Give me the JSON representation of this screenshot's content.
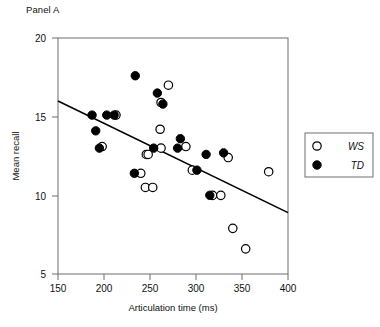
{
  "panel": {
    "label": "Panel A"
  },
  "axes": {
    "x_title": "Articulation time (ms)",
    "y_title": "Mean recall",
    "x_ticks": [
      "150",
      "200",
      "250",
      "300",
      "350",
      "400"
    ],
    "y_ticks": [
      "20",
      "15",
      "10",
      "5"
    ]
  },
  "legend": {
    "items": [
      {
        "label": "WS",
        "marker": "open-circle"
      },
      {
        "label": "TD",
        "marker": "filled-circle"
      }
    ]
  },
  "chart_data": {
    "type": "scatter",
    "title": "Panel A",
    "xlabel": "Articulation time (ms)",
    "ylabel": "Mean recall",
    "xlim": [
      150,
      400
    ],
    "ylim": [
      5,
      20
    ],
    "xticks": [
      150,
      200,
      250,
      300,
      350,
      400
    ],
    "yticks": [
      5,
      10,
      15,
      20
    ],
    "grid": false,
    "legend_position": "right-outside",
    "series": [
      {
        "name": "WS",
        "marker": "open-circle",
        "color": "#ffffff",
        "edge_color": "#000000",
        "points": [
          {
            "x": 213,
            "y": 15.1
          },
          {
            "x": 270,
            "y": 17.0
          },
          {
            "x": 262,
            "y": 15.9
          },
          {
            "x": 261,
            "y": 14.2
          },
          {
            "x": 262,
            "y": 13.0
          },
          {
            "x": 198,
            "y": 13.1
          },
          {
            "x": 246,
            "y": 12.6
          },
          {
            "x": 240,
            "y": 11.4
          },
          {
            "x": 245,
            "y": 10.5
          },
          {
            "x": 253,
            "y": 10.5
          },
          {
            "x": 248,
            "y": 12.6
          },
          {
            "x": 289,
            "y": 13.1
          },
          {
            "x": 296,
            "y": 11.6
          },
          {
            "x": 335,
            "y": 12.4
          },
          {
            "x": 318,
            "y": 10.0
          },
          {
            "x": 327,
            "y": 10.0
          },
          {
            "x": 379,
            "y": 11.5
          },
          {
            "x": 340,
            "y": 7.9
          },
          {
            "x": 354,
            "y": 6.6
          }
        ]
      },
      {
        "name": "TD",
        "marker": "filled-circle",
        "color": "#000000",
        "edge_color": "#000000",
        "points": [
          {
            "x": 187,
            "y": 15.1
          },
          {
            "x": 203,
            "y": 15.1
          },
          {
            "x": 211,
            "y": 15.1
          },
          {
            "x": 191,
            "y": 14.1
          },
          {
            "x": 195,
            "y": 13.0
          },
          {
            "x": 234,
            "y": 17.6
          },
          {
            "x": 258,
            "y": 16.5
          },
          {
            "x": 264,
            "y": 15.8
          },
          {
            "x": 254,
            "y": 13.0
          },
          {
            "x": 233,
            "y": 11.4
          },
          {
            "x": 283,
            "y": 13.6
          },
          {
            "x": 280,
            "y": 13.0
          },
          {
            "x": 311,
            "y": 12.6
          },
          {
            "x": 330,
            "y": 12.7
          },
          {
            "x": 301,
            "y": 11.6
          },
          {
            "x": 315,
            "y": 10.0
          }
        ]
      }
    ],
    "fit_line": {
      "label": "regression line",
      "x_start": 150,
      "y_start": 16.0,
      "x_end": 400,
      "y_end": 8.9
    }
  }
}
